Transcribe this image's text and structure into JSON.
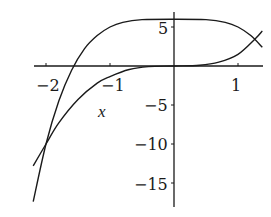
{
  "chart_data": {
    "type": "line",
    "title": "",
    "xlabel": "x",
    "ylabel": "",
    "xlim": [
      -2.2,
      1.38
    ],
    "ylim": [
      -17.5,
      6.9
    ],
    "grid": false,
    "legend": null,
    "x_ticks": [
      {
        "value": -2,
        "label": "−2"
      },
      {
        "value": -1,
        "label": "−1"
      },
      {
        "value": 1,
        "label": "1"
      }
    ],
    "y_ticks": [
      {
        "value": 5,
        "label": "5"
      },
      {
        "value": -5,
        "label": "−5"
      },
      {
        "value": -10,
        "label": "−10"
      },
      {
        "value": -15,
        "label": "−15"
      }
    ],
    "series": [
      {
        "name": "curve-plateau",
        "description": "flat near y≈6, falling steeply on both sides",
        "x": [
          -2.2,
          -2.0,
          -1.8,
          -1.6,
          -1.4,
          -1.2,
          -1.0,
          -0.8,
          -0.5,
          0.0,
          0.5,
          0.8,
          1.0,
          1.2,
          1.38
        ],
        "y": [
          -17.4,
          -10.0,
          -4.5,
          -0.55,
          2.2,
          3.9,
          5.0,
          5.6,
          5.94,
          6.0,
          5.94,
          5.6,
          5.0,
          3.9,
          2.4
        ]
      },
      {
        "name": "curve-cubic",
        "description": "passes through origin, rising left-to-right",
        "x": [
          -2.2,
          -2.0,
          -1.8,
          -1.5,
          -1.2,
          -1.0,
          -0.7,
          -0.4,
          0.0,
          0.4,
          0.7,
          1.0,
          1.27,
          1.38
        ],
        "y": [
          -12.8,
          -10.0,
          -7.3,
          -4.3,
          -2.2,
          -1.35,
          -0.45,
          -0.08,
          0.0,
          0.1,
          0.5,
          1.5,
          3.5,
          4.5
        ]
      }
    ],
    "annotations": [
      {
        "text": "intersection",
        "x": -2.0,
        "y": -10.0
      },
      {
        "text": "intersection",
        "x": 1.27,
        "y": 3.5
      }
    ]
  },
  "labels": {
    "x_axis": "x",
    "tick_x_m2": "−2",
    "tick_x_m1": "−1",
    "tick_x_1": "1",
    "tick_y_5": "5",
    "tick_y_m5": "−5",
    "tick_y_m10": "−10",
    "tick_y_m15": "−15"
  },
  "colors": {
    "line": "#1a1a1a",
    "axis": "#1a1a1a",
    "background": "#ffffff"
  }
}
